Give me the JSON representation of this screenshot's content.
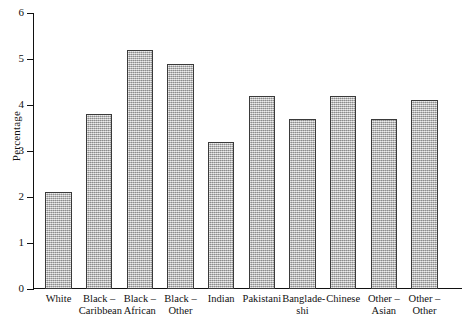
{
  "chart_data": {
    "type": "bar",
    "title": "",
    "xlabel": "",
    "ylabel": "Percentage",
    "ylim": [
      0,
      6
    ],
    "yticks": [
      "0",
      "1",
      "2",
      "3",
      "4",
      "5",
      "6"
    ],
    "grid": false,
    "legend": "none",
    "bar_color": "#a9a9a9",
    "bar_edge_color": "#3a3a3a",
    "categories": [
      "White",
      "Black –\nCaribbean",
      "Black –\nAfrican",
      "Black –\nOther",
      "Indian",
      "Pakistani",
      "Banglade-\nshi",
      "Chinese",
      "Other –\nAsian",
      "Other –\nOther"
    ],
    "values": [
      2.1,
      3.8,
      5.2,
      4.9,
      3.2,
      4.2,
      3.7,
      4.2,
      3.7,
      4.1
    ]
  }
}
